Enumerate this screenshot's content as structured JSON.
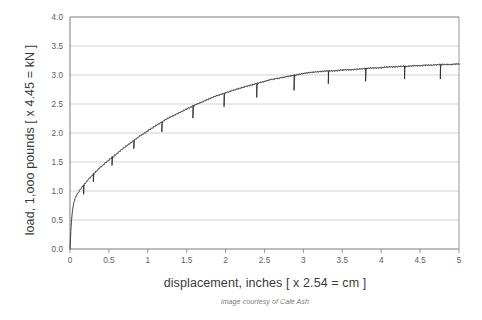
{
  "chart_data": {
    "type": "line",
    "title": "",
    "subtitle": "",
    "xlabel": "displacement, inches [ x 2.54 = cm ]",
    "ylabel": "load, 1,ooo pounds [ x 4.45 = kN ]",
    "caption": "image courtesy of Cale Ash",
    "xlim": [
      0,
      5
    ],
    "ylim": [
      0,
      4.0
    ],
    "xticks": [
      "0",
      "0.5",
      "1",
      "1.5",
      "2",
      "2.5",
      "3",
      "3.5",
      "4",
      "4.5",
      "5"
    ],
    "xtick_values": [
      0,
      0.5,
      1,
      1.5,
      2,
      2.5,
      3,
      3.5,
      4,
      4.5,
      5
    ],
    "yticks": [
      "0.0",
      "0.5",
      "1.0",
      "1.5",
      "2.0",
      "2.5",
      "3.0",
      "3.5",
      "4.0"
    ],
    "ytick_values": [
      0,
      0.5,
      1.0,
      1.5,
      2.0,
      2.5,
      3.0,
      3.5,
      4.0
    ],
    "grid": "horizontal",
    "legend": "none",
    "line_color": "#2b2b2b",
    "grid_color": "#c8c8c8",
    "axis_color": "#808080",
    "series": [
      {
        "name": "load-displacement",
        "x": [
          0.0,
          0.004,
          0.008,
          0.012,
          0.018,
          0.025,
          0.032,
          0.04,
          0.05,
          0.062,
          0.075,
          0.09,
          0.105,
          0.12,
          0.14,
          0.16,
          0.18,
          0.2,
          0.225,
          0.25,
          0.275,
          0.3,
          0.33,
          0.36,
          0.39,
          0.42,
          0.45,
          0.48,
          0.52,
          0.56,
          0.6,
          0.65,
          0.7,
          0.75,
          0.8,
          0.85,
          0.9,
          0.95,
          1.0,
          1.06,
          1.12,
          1.18,
          1.24,
          1.3,
          1.36,
          1.42,
          1.48,
          1.54,
          1.6,
          1.67,
          1.74,
          1.81,
          1.88,
          1.95,
          2.02,
          2.1,
          2.18,
          2.26,
          2.34,
          2.42,
          2.5,
          2.58,
          2.66,
          2.74,
          2.82,
          2.9,
          2.98,
          3.06,
          3.14,
          3.22,
          3.3,
          3.38,
          3.46,
          3.54,
          3.62,
          3.7,
          3.78,
          3.86,
          3.94,
          4.02,
          4.1,
          4.18,
          4.26,
          4.34,
          4.42,
          4.5,
          4.58,
          4.66,
          4.74,
          4.82,
          4.9,
          4.96,
          5.0
        ],
        "y": [
          0.0,
          0.1,
          0.22,
          0.34,
          0.46,
          0.57,
          0.66,
          0.73,
          0.8,
          0.86,
          0.9,
          0.94,
          0.97,
          1.0,
          1.04,
          1.08,
          1.11,
          1.14,
          1.18,
          1.22,
          1.25,
          1.29,
          1.33,
          1.37,
          1.41,
          1.44,
          1.48,
          1.51,
          1.56,
          1.6,
          1.64,
          1.7,
          1.75,
          1.8,
          1.85,
          1.9,
          1.95,
          1.99,
          2.04,
          2.09,
          2.14,
          2.19,
          2.24,
          2.28,
          2.32,
          2.36,
          2.4,
          2.44,
          2.48,
          2.52,
          2.56,
          2.6,
          2.64,
          2.67,
          2.7,
          2.74,
          2.77,
          2.8,
          2.83,
          2.86,
          2.89,
          2.92,
          2.94,
          2.96,
          2.98,
          3.0,
          3.02,
          3.04,
          3.05,
          3.06,
          3.07,
          3.07,
          3.08,
          3.09,
          3.09,
          3.1,
          3.11,
          3.12,
          3.12,
          3.13,
          3.14,
          3.14,
          3.15,
          3.15,
          3.16,
          3.16,
          3.17,
          3.17,
          3.18,
          3.18,
          3.18,
          3.19,
          3.19
        ],
        "load_drop_spikes": [
          {
            "x": 0.175,
            "depth": 0.16
          },
          {
            "x": 0.3,
            "depth": 0.13
          },
          {
            "x": 0.54,
            "depth": 0.14
          },
          {
            "x": 0.82,
            "depth": 0.14
          },
          {
            "x": 1.18,
            "depth": 0.17
          },
          {
            "x": 1.58,
            "depth": 0.21
          },
          {
            "x": 1.98,
            "depth": 0.23
          },
          {
            "x": 2.4,
            "depth": 0.24
          },
          {
            "x": 2.88,
            "depth": 0.26
          },
          {
            "x": 3.32,
            "depth": 0.22
          },
          {
            "x": 3.8,
            "depth": 0.22
          },
          {
            "x": 4.3,
            "depth": 0.22
          },
          {
            "x": 4.76,
            "depth": 0.25
          }
        ],
        "serration_amplitude": 0.018,
        "peak_load": 3.19,
        "plateau_load": 3.1
      }
    ]
  }
}
